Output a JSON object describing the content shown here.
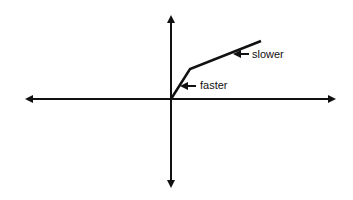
{
  "diagram": {
    "labels": {
      "slower": "slower",
      "faster": "faster"
    },
    "colors": {
      "line": "#111111",
      "background": "#ffffff"
    },
    "axes": {
      "x_range_px": [
        25,
        336
      ],
      "y_range_px": [
        15,
        188
      ],
      "origin_px": [
        171,
        99
      ]
    },
    "curve_points_px": [
      [
        171,
        99
      ],
      [
        190,
        69
      ],
      [
        261,
        41
      ]
    ]
  }
}
